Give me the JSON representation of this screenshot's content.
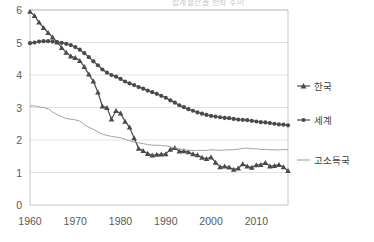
{
  "title": "합계출산율 변화 추이",
  "chart_data": {
    "type": "line",
    "title": "합계출산율 변화 추이",
    "xlabel": "",
    "ylabel": "",
    "xlim": [
      1960,
      2017
    ],
    "ylim": [
      0,
      6
    ],
    "ytick_labels": [
      "0",
      "1",
      "2",
      "3",
      "4",
      "5",
      "6"
    ],
    "yticks": [
      0,
      1,
      2,
      3,
      4,
      5,
      6
    ],
    "xtick_labels": [
      "1960",
      "1970",
      "1980",
      "1990",
      "2000",
      "2010"
    ],
    "xticks": [
      1960,
      1970,
      1980,
      1990,
      2000,
      2010
    ],
    "grid": true,
    "legend_position": "right",
    "series": [
      {
        "name": "한국",
        "marker": "triangle",
        "color": "#4a4a4a",
        "x": [
          1960,
          1961,
          1962,
          1963,
          1964,
          1965,
          1966,
          1967,
          1968,
          1969,
          1970,
          1971,
          1972,
          1973,
          1974,
          1975,
          1976,
          1977,
          1978,
          1979,
          1980,
          1981,
          1982,
          1983,
          1984,
          1985,
          1986,
          1987,
          1988,
          1989,
          1990,
          1991,
          1992,
          1993,
          1994,
          1995,
          1996,
          1997,
          1998,
          1999,
          2000,
          2001,
          2002,
          2003,
          2004,
          2005,
          2006,
          2007,
          2008,
          2009,
          2010,
          2011,
          2012,
          2013,
          2014,
          2015,
          2016,
          2017
        ],
        "values": [
          5.95,
          5.82,
          5.62,
          5.45,
          5.3,
          5.16,
          5.01,
          4.84,
          4.69,
          4.58,
          4.53,
          4.44,
          4.25,
          4.02,
          3.81,
          3.47,
          3.04,
          2.99,
          2.64,
          2.9,
          2.82,
          2.57,
          2.39,
          2.06,
          1.74,
          1.67,
          1.58,
          1.53,
          1.55,
          1.56,
          1.57,
          1.71,
          1.76,
          1.65,
          1.66,
          1.63,
          1.57,
          1.54,
          1.46,
          1.42,
          1.47,
          1.31,
          1.17,
          1.19,
          1.16,
          1.09,
          1.13,
          1.26,
          1.19,
          1.15,
          1.23,
          1.24,
          1.3,
          1.19,
          1.21,
          1.24,
          1.17,
          1.05
        ]
      },
      {
        "name": "세계",
        "marker": "circle",
        "color": "#4a4a4a",
        "x": [
          1960,
          1961,
          1962,
          1963,
          1964,
          1965,
          1966,
          1967,
          1968,
          1969,
          1970,
          1971,
          1972,
          1973,
          1974,
          1975,
          1976,
          1977,
          1978,
          1979,
          1980,
          1981,
          1982,
          1983,
          1984,
          1985,
          1986,
          1987,
          1988,
          1989,
          1990,
          1991,
          1992,
          1993,
          1994,
          1995,
          1996,
          1997,
          1998,
          1999,
          2000,
          2001,
          2002,
          2003,
          2004,
          2005,
          2006,
          2007,
          2008,
          2009,
          2010,
          2011,
          2012,
          2013,
          2014,
          2015,
          2016,
          2017
        ],
        "values": [
          4.98,
          5.0,
          5.03,
          5.04,
          5.04,
          5.03,
          5.01,
          4.99,
          4.96,
          4.92,
          4.86,
          4.78,
          4.67,
          4.55,
          4.42,
          4.3,
          4.17,
          4.07,
          4.0,
          3.95,
          3.88,
          3.8,
          3.74,
          3.69,
          3.63,
          3.58,
          3.52,
          3.47,
          3.42,
          3.36,
          3.3,
          3.22,
          3.15,
          3.07,
          3.01,
          2.95,
          2.9,
          2.85,
          2.81,
          2.77,
          2.74,
          2.72,
          2.7,
          2.68,
          2.67,
          2.65,
          2.63,
          2.62,
          2.61,
          2.59,
          2.57,
          2.55,
          2.54,
          2.52,
          2.5,
          2.48,
          2.47,
          2.45
        ]
      },
      {
        "name": "고소득국",
        "marker": "line",
        "color": "#9a9a9a",
        "x": [
          1960,
          1961,
          1962,
          1963,
          1964,
          1965,
          1966,
          1967,
          1968,
          1969,
          1970,
          1971,
          1972,
          1973,
          1974,
          1975,
          1976,
          1977,
          1978,
          1979,
          1980,
          1981,
          1982,
          1983,
          1984,
          1985,
          1986,
          1987,
          1988,
          1989,
          1990,
          1991,
          1992,
          1993,
          1994,
          1995,
          1996,
          1997,
          1998,
          1999,
          2000,
          2001,
          2002,
          2003,
          2004,
          2005,
          2006,
          2007,
          2008,
          2009,
          2010,
          2011,
          2012,
          2013,
          2014,
          2015,
          2016,
          2017
        ],
        "values": [
          3.05,
          3.05,
          3.02,
          3.0,
          2.96,
          2.86,
          2.78,
          2.72,
          2.66,
          2.64,
          2.62,
          2.58,
          2.47,
          2.39,
          2.33,
          2.25,
          2.18,
          2.14,
          2.11,
          2.09,
          2.07,
          2.02,
          1.98,
          1.94,
          1.91,
          1.89,
          1.86,
          1.84,
          1.84,
          1.83,
          1.82,
          1.79,
          1.76,
          1.73,
          1.7,
          1.68,
          1.68,
          1.68,
          1.68,
          1.68,
          1.7,
          1.69,
          1.68,
          1.69,
          1.7,
          1.7,
          1.72,
          1.74,
          1.75,
          1.73,
          1.73,
          1.71,
          1.71,
          1.7,
          1.7,
          1.69,
          1.71,
          1.7
        ]
      }
    ]
  }
}
